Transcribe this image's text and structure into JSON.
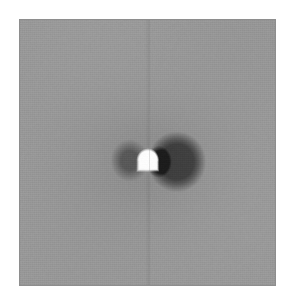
{
  "figure": {
    "panel_name": "dipole-field-map",
    "background_gray": "#9e9e9e",
    "border_color": "#8e8e8e",
    "page_background": "#ffffff",
    "panel": {
      "x": 19,
      "y": 19,
      "width": 257,
      "height": 267
    }
  },
  "chart_data": {
    "type": "heatmap",
    "title": "",
    "subtitle": "",
    "xlabel": "",
    "ylabel": "",
    "grid": false,
    "legend": "none",
    "colormap": "grayscale",
    "colormap_stops": [
      {
        "position": 0.0,
        "color": "#1c1c1c",
        "label": "min"
      },
      {
        "position": 0.28,
        "color": "#5a5a5a",
        "label": ""
      },
      {
        "position": 0.52,
        "color": "#9e9e9e",
        "label": "background"
      },
      {
        "position": 0.78,
        "color": "#d4d4d4",
        "label": ""
      },
      {
        "position": 1.0,
        "color": "#fdfdfd",
        "label": "max"
      }
    ],
    "value_range": [
      -1.0,
      1.0
    ],
    "background_value": 0.0,
    "xlim": [
      -1.0,
      1.0
    ],
    "ylim": [
      -1.0,
      1.0
    ],
    "tick_labels_x": [],
    "tick_labels_y": [],
    "annotations": [],
    "features": [
      {
        "name": "bright-source-dome",
        "shape": "dome",
        "center_x_pct": 50.2,
        "center_y_pct": 53.0,
        "width_pct": 9.0,
        "height_pct": 9.0,
        "peak_value": 1.0,
        "color": "#fdfdfd"
      },
      {
        "name": "right-dark-lobe",
        "shape": "ellipse",
        "center_x_pct": 61.5,
        "center_y_pct": 53.5,
        "width_pct": 23.0,
        "height_pct": 23.0,
        "peak_value": -0.62,
        "color": "#666666"
      },
      {
        "name": "inner-right-dark-core",
        "shape": "ellipse",
        "center_x_pct": 54.5,
        "center_y_pct": 53.5,
        "width_pct": 10.0,
        "height_pct": 12.0,
        "peak_value": -0.92,
        "color": "#2a2a2a"
      },
      {
        "name": "left-dark-lobe",
        "shape": "ellipse",
        "center_x_pct": 43.0,
        "center_y_pct": 53.0,
        "width_pct": 15.0,
        "height_pct": 16.0,
        "peak_value": -0.38,
        "color": "#7d7d7d"
      },
      {
        "name": "outer-halo",
        "shape": "ellipse",
        "center_x_pct": 52.0,
        "center_y_pct": 53.0,
        "width_pct": 52.0,
        "height_pct": 42.0,
        "peak_value": -0.08,
        "color": "#969696"
      },
      {
        "name": "vertical-seam-line",
        "shape": "line",
        "center_x_pct": 50.2,
        "orientation": "vertical",
        "peak_value": -0.05,
        "color": "#787878"
      }
    ]
  }
}
